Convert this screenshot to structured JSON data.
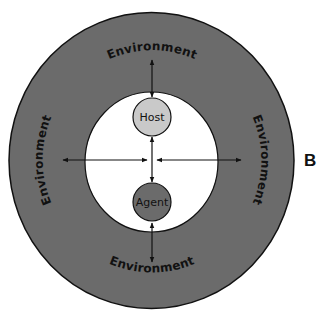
{
  "figure": {
    "panel_label": "B",
    "colors": {
      "environment_ring": "#6b6b6b",
      "inner_space": "#ffffff",
      "host_fill": "#c9c9c9",
      "agent_fill": "#6b6b6b",
      "outline": "#111111"
    },
    "environment_labels": {
      "top": "Environment",
      "bottom": "Environment",
      "left": "Environment",
      "right": "Environment"
    },
    "nodes": {
      "host": {
        "label": "Host"
      },
      "agent": {
        "label": "Agent"
      }
    },
    "arrows": [
      {
        "from": "Environment (top)",
        "to": "Host",
        "direction": "bidirectional"
      },
      {
        "from": "Host",
        "to": "Agent",
        "direction": "bidirectional"
      },
      {
        "from": "Agent",
        "to": "Environment (bottom)",
        "direction": "bidirectional"
      },
      {
        "from": "Environment (left)",
        "to": "center",
        "direction": "bidirectional"
      },
      {
        "from": "center",
        "to": "Environment (right)",
        "direction": "bidirectional"
      }
    ]
  }
}
